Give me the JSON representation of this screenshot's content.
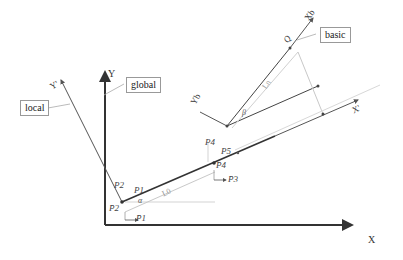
{
  "diagram": {
    "axes": {
      "global_x": "X",
      "global_y": "Y",
      "local_x": "X'",
      "local_y": "Y'",
      "basic_x": "Xb",
      "basic_y": "Yb"
    },
    "callouts": {
      "local": "local",
      "global": "global",
      "basic": "basic"
    },
    "points": {
      "P1": "P1",
      "P2": "P2",
      "P4": "P4",
      "P5": "P5",
      "P1bar": "P̄1",
      "P2bar": "P̄2",
      "P3bar": "P̄3",
      "P4bar": "P̄4",
      "Q": "Q"
    },
    "lengths": {
      "L0": "L0",
      "Ln": "Ln"
    },
    "angles": {
      "alpha": "α",
      "beta": "β"
    },
    "colors": {
      "axis": "#333333",
      "light": "#c8c8c8",
      "box_border": "#999999"
    }
  }
}
